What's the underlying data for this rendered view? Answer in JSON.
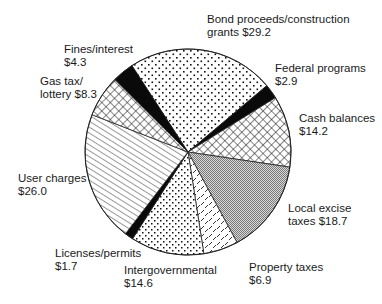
{
  "chart_data": {
    "type": "pie",
    "title": "",
    "units": "$",
    "center": [
      188,
      152
    ],
    "radius": 103,
    "start_angle_deg": -33,
    "direction": "clockwise",
    "slices": [
      {
        "name": "Bond proceeds/construction grants",
        "value": 29.2,
        "pattern": "sparse-dots",
        "label_lines": [
          "Bond proceeds/construction",
          "grants $29.2"
        ],
        "label_pos": [
          207,
          13
        ]
      },
      {
        "name": "Federal programs",
        "value": 2.9,
        "pattern": "solid-black",
        "label_lines": [
          "Federal programs",
          "$2.9"
        ],
        "label_pos": [
          275,
          62
        ]
      },
      {
        "name": "Cash balances",
        "value": 14.2,
        "pattern": "crosshatch",
        "label_lines": [
          "Cash balances",
          "$14.2"
        ],
        "label_pos": [
          299,
          112
        ]
      },
      {
        "name": "Local excise taxes",
        "value": 18.7,
        "pattern": "fine-gray",
        "label_lines": [
          "Local excise",
          "taxes $18.7"
        ],
        "label_pos": [
          288,
          202
        ]
      },
      {
        "name": "Property taxes",
        "value": 6.9,
        "pattern": "dashes",
        "label_lines": [
          "Property taxes",
          "$6.9"
        ],
        "label_pos": [
          249,
          261
        ]
      },
      {
        "name": "Intergovernmental",
        "value": 14.6,
        "pattern": "dense-dots",
        "label_lines": [
          "Intergovernmental",
          "$14.6"
        ],
        "label_pos": [
          124,
          264
        ]
      },
      {
        "name": "Licenses/permits",
        "value": 1.7,
        "pattern": "solid-black",
        "label_lines": [
          "Licenses/permits",
          "$1.7"
        ],
        "label_pos": [
          55,
          247
        ]
      },
      {
        "name": "User charges",
        "value": 26.0,
        "pattern": "diagonal-lines",
        "label_lines": [
          "User charges",
          "$26.0"
        ],
        "label_pos": [
          18,
          172
        ]
      },
      {
        "name": "Gas tax/lottery",
        "value": 8.3,
        "pattern": "crosshatch",
        "label_lines": [
          "Gas tax/",
          "lottery $8.3"
        ],
        "label_pos": [
          40,
          75
        ]
      },
      {
        "name": "Fines/interest",
        "value": 4.3,
        "pattern": "solid-black",
        "label_lines": [
          "Fines/interest",
          "$4.3"
        ],
        "label_pos": [
          64,
          43
        ]
      }
    ],
    "total": 126.8,
    "legend": "none (direct labels)"
  }
}
